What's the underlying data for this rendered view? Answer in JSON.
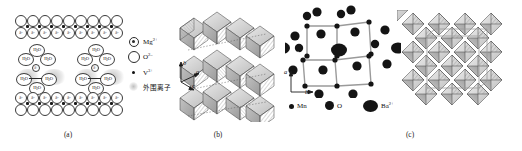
{
  "figure": {
    "type": "scientific-figure",
    "panel_count": 3,
    "background": "#ffffff",
    "ink": "#1a1a1a"
  },
  "captions": {
    "a": "(a)",
    "b": "(b)",
    "c": "(c)"
  },
  "panel_a": {
    "title_omitted": "",
    "description": "Hydrated interlayer ion model between two oxide layers",
    "layer_charge_label": "δ-",
    "ion_charge_label": "δ+",
    "water_label": "H₂O",
    "water_label_main": "H",
    "water_label_sub": "2",
    "water_label_tail": "O",
    "clusters": 2,
    "waters_per_cluster": 6,
    "legend": [
      {
        "key": "mg",
        "symbol": "circle-with-dot",
        "label": "Mg",
        "charge": "2+"
      },
      {
        "key": "o",
        "symbol": "open-circle",
        "label": "O",
        "charge": "2–"
      },
      {
        "key": "v",
        "symbol": "filled-dot",
        "label": "V",
        "charge": "3+"
      },
      {
        "key": "halo",
        "symbol": "shaded-circle",
        "label": "外围离子",
        "charge": ""
      }
    ]
  },
  "panel_b": {
    "description": "Polyhedral layered crystal structure viewed along axes",
    "axes": [
      {
        "name": "b",
        "direction": "up"
      },
      {
        "name": "a",
        "direction": "upper-right"
      },
      {
        "name": "c",
        "direction": "lower-right"
      }
    ]
  },
  "panel_c": {
    "description": "Ball-and-stick tunnel structure plus polyhedral framework",
    "axes": [
      {
        "name": "a",
        "direction": "up"
      },
      {
        "name": "b",
        "direction": "right"
      }
    ],
    "legend": [
      {
        "key": "mn",
        "label": "Mn",
        "charge": "",
        "size": "small"
      },
      {
        "key": "o",
        "label": "O",
        "charge": "",
        "size": "medium"
      },
      {
        "key": "ba",
        "label": "Ba",
        "charge": "2+",
        "size": "large"
      }
    ]
  }
}
